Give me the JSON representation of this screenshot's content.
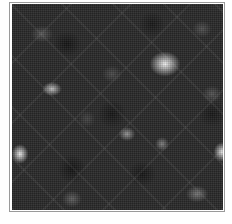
{
  "image": {
    "description": "Grayscale cellular noise texture with bright diffuse spots and diagonal streaks",
    "background_color": "#2a2a2a",
    "frame_color": "#9a9a9a",
    "highlight_color": "#ffffff"
  }
}
